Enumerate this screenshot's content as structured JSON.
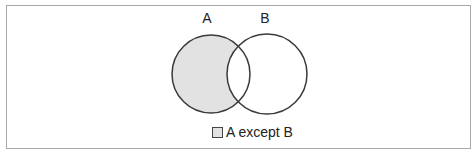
{
  "diagram": {
    "type": "venn",
    "sets": [
      {
        "name": "A",
        "label": "A",
        "shaded": true
      },
      {
        "name": "B",
        "label": "B",
        "shaded": false
      }
    ],
    "shaded_region": "A except B",
    "colors": {
      "fill": "#e2e2e2",
      "stroke": "#3a3a3a",
      "frame": "#a8a8a8"
    }
  },
  "legend": {
    "items": [
      {
        "label": "A except B",
        "color": "#e2e2e2"
      }
    ]
  }
}
